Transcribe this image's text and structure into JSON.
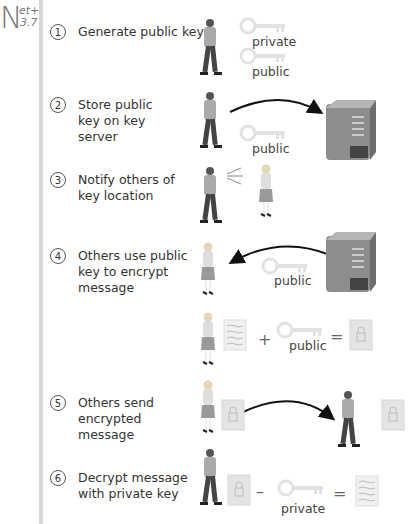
{
  "logo": {
    "letter": "N",
    "superscript": "et+",
    "subscript": "3.7"
  },
  "steps": [
    {
      "num": "1",
      "text": "Generate public key"
    },
    {
      "num": "2",
      "text": "Store public key on key server"
    },
    {
      "num": "3",
      "text": "Notify others of key location"
    },
    {
      "num": "4",
      "text": "Others use public key to encrypt message"
    },
    {
      "num": "5",
      "text": "Others send encrypted message"
    },
    {
      "num": "6",
      "text": "Decrypt message with private key"
    }
  ],
  "labels": {
    "s1_private": "private",
    "s1_public": "public",
    "s2_public": "public",
    "s4_public": "public",
    "s4b_public": "public",
    "s6_private": "private"
  },
  "operators": {
    "plus": "+",
    "equals1": "=",
    "minus": "–",
    "equals2": "="
  },
  "colors": {
    "sidebar_bar": "#d6d6d6",
    "server": "#8a8a8a",
    "key": "#e6e6e6",
    "lock_doc": "#e4e4e4"
  }
}
